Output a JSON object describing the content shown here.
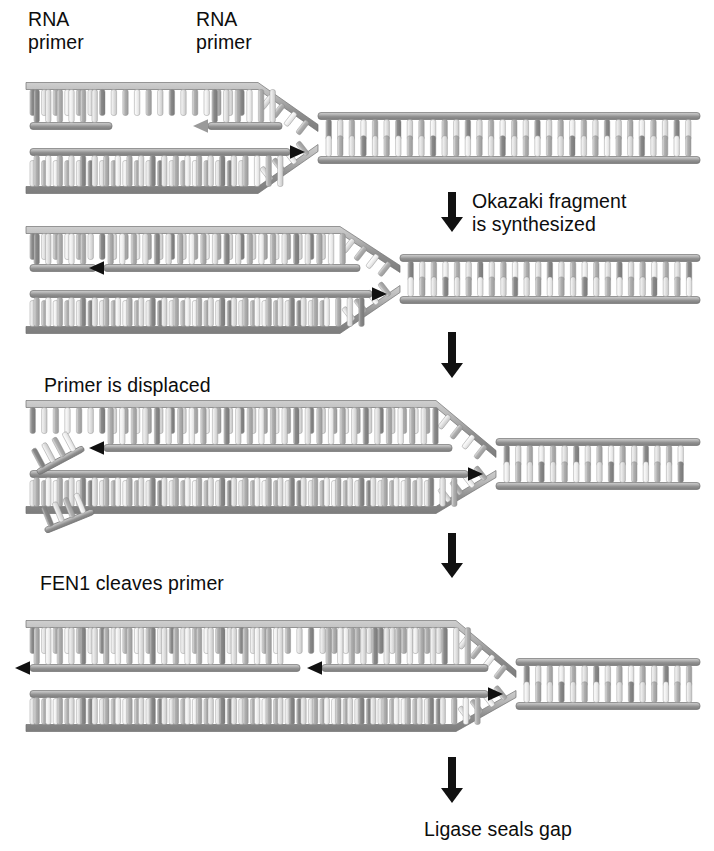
{
  "figure": {
    "background": "#ffffff",
    "width": 714,
    "height": 851
  },
  "palette": {
    "backbone_dark": "#8f8f8f",
    "backbone_light": "#b9b9b9",
    "backbone_edge": "#6f6f6f",
    "rung_dark": "#8a8a8a",
    "rung_mid": "#b0b0b0",
    "rung_light": "#e2e2e2",
    "rung_pale": "#f0f0f0",
    "arrow_black": "#111111",
    "arrow_gray": "#9a9a9a",
    "text": "#0d0d0d"
  },
  "labels": [
    {
      "id": "rna-primer-left",
      "text": "RNA\nprimer",
      "x": 28,
      "y": 8
    },
    {
      "id": "rna-primer-right",
      "text": "RNA\nprimer",
      "x": 196,
      "y": 8
    },
    {
      "id": "okazaki-step",
      "text": "Okazaki fragment\nis synthesized",
      "x": 472,
      "y": 190
    },
    {
      "id": "primer-displaced",
      "text": "Primer is displaced",
      "x": 44,
      "y": 374
    },
    {
      "id": "fen1-cleaves",
      "text": "FEN1 cleaves primer",
      "x": 40,
      "y": 572
    },
    {
      "id": "ligase-seals",
      "text": "Ligase seals gap",
      "x": 424,
      "y": 818
    }
  ],
  "step_arrows": [
    {
      "id": "step-arrow-1",
      "x": 452,
      "y_top": 192,
      "y_bottom": 232
    },
    {
      "id": "step-arrow-2",
      "x": 452,
      "y_top": 332,
      "y_bottom": 378
    },
    {
      "id": "step-arrow-3",
      "x": 452,
      "y_top": 533,
      "y_bottom": 578
    },
    {
      "id": "step-arrow-4",
      "x": 452,
      "y_top": 757,
      "y_bottom": 803
    }
  ],
  "panels": [
    {
      "id": "panel-1",
      "caption": "Lagging strand with two RNA primers; fork open",
      "stage": "primers-bound",
      "fork_x": 318,
      "duplex_right": {
        "x1": 318,
        "x2": 700,
        "y_top": 116,
        "y_bottom": 160,
        "rungs": 28
      },
      "lagging_template": {
        "x1": 26,
        "x2": 300,
        "y": 86
      },
      "leading_template": {
        "x1": 26,
        "x2": 300,
        "y": 190
      },
      "nascent_segments": [
        {
          "name": "okazaki-fragment-old",
          "x1": 30,
          "x2": 112,
          "y": 126,
          "kind": "primer",
          "arrow": "none"
        },
        {
          "name": "rna-primer-new",
          "x1": 208,
          "x2": 282,
          "y": 126,
          "kind": "primer",
          "arrow": "left-gray"
        },
        {
          "name": "leading-strand",
          "x1": 30,
          "x2": 290,
          "y": 152,
          "kind": "dna",
          "arrow": "right-black"
        }
      ]
    },
    {
      "id": "panel-2",
      "caption": "Okazaki fragment extended toward previous primer",
      "stage": "fragment-synthesized",
      "fork_x": 400,
      "duplex_right": {
        "x1": 400,
        "x2": 700,
        "y_top": 258,
        "y_bottom": 300,
        "rungs": 22
      },
      "lagging_template": {
        "x1": 26,
        "x2": 382,
        "y": 230
      },
      "leading_template": {
        "x1": 26,
        "x2": 382,
        "y": 330
      },
      "nascent_segments": [
        {
          "name": "okazaki-fragment-old",
          "x1": 30,
          "x2": 96,
          "y": 268,
          "kind": "primer",
          "arrow": "none"
        },
        {
          "name": "okazaki-fragment-new",
          "x1": 104,
          "x2": 360,
          "y": 268,
          "kind": "dna",
          "arrow": "left-black"
        },
        {
          "name": "leading-strand",
          "x1": 30,
          "x2": 372,
          "y": 294,
          "kind": "dna",
          "arrow": "right-black"
        }
      ]
    },
    {
      "id": "panel-3",
      "caption": "Strand displacement lifts the downstream RNA primer into a flap",
      "stage": "primer-displaced",
      "fork_x": 496,
      "duplex_right": {
        "x1": 496,
        "x2": 700,
        "y_top": 442,
        "y_bottom": 486,
        "rungs": 15
      },
      "lagging_template": {
        "x1": 26,
        "x2": 478,
        "y": 404
      },
      "leading_template": {
        "x1": 26,
        "x2": 478,
        "y": 510
      },
      "nascent_segments": [
        {
          "name": "okazaki-fragment-new",
          "x1": 104,
          "x2": 452,
          "y": 448,
          "kind": "dna",
          "arrow": "left-black"
        },
        {
          "name": "leading-strand",
          "x1": 30,
          "x2": 468,
          "y": 474,
          "kind": "dna",
          "arrow": "right-black"
        }
      ],
      "flap": {
        "name": "displaced-primer-flap",
        "x": 36,
        "y": 470,
        "rungs": 4,
        "angle": -28
      }
    },
    {
      "id": "panel-4",
      "caption": "Cleaved primer released; nicked fragments abut",
      "stage": "fen1-cleaved",
      "fork_x": 516,
      "duplex_right": {
        "x1": 516,
        "x2": 700,
        "y_top": 662,
        "y_bottom": 706,
        "rungs": 13
      },
      "lagging_template": {
        "x1": 26,
        "x2": 498,
        "y": 624
      },
      "leading_template": {
        "x1": 26,
        "x2": 498,
        "y": 728
      },
      "nascent_segments": [
        {
          "name": "okazaki-fragment-old",
          "x1": 30,
          "x2": 300,
          "y": 668,
          "kind": "dna",
          "arrow": "left-black"
        },
        {
          "name": "okazaki-fragment-new",
          "x1": 322,
          "x2": 488,
          "y": 668,
          "kind": "dna",
          "arrow": "left-black"
        },
        {
          "name": "leading-strand",
          "x1": 30,
          "x2": 488,
          "y": 694,
          "kind": "dna",
          "arrow": "right-black"
        }
      ]
    }
  ],
  "free_primer": {
    "name": "released-rna-primer",
    "x": 44,
    "y": 528,
    "rungs": 4,
    "angle": -22
  }
}
